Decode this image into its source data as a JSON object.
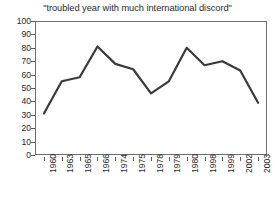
{
  "chart_data": {
    "type": "line",
    "title": "\"troubled year with much international discord\"",
    "xlabel": "",
    "ylabel": "",
    "ylim": [
      0,
      100
    ],
    "yticks": [
      0,
      10,
      20,
      30,
      40,
      50,
      60,
      70,
      80,
      90,
      100
    ],
    "grid": false,
    "legend": "none",
    "line_color": "#3a3a3a",
    "categories": [
      "1960",
      "1963",
      "1965",
      "1966",
      "1974",
      "1975",
      "1978",
      "1979",
      "1980",
      "1998",
      "1999",
      "2002",
      "2003"
    ],
    "values": [
      31,
      55,
      58,
      81,
      68,
      64,
      46,
      55,
      80,
      67,
      70,
      63,
      39
    ]
  }
}
